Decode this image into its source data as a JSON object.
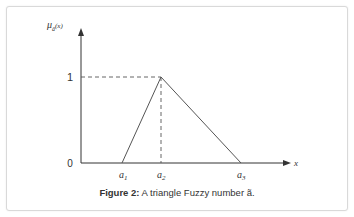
{
  "figure": {
    "caption_label": "Figure 2:",
    "caption_text": " A triangle Fuzzy number ã."
  },
  "diagram": {
    "y_axis_label": "μ",
    "y_axis_label_sub": "ã",
    "y_axis_label_arg": "(x)",
    "x_axis_label": "x",
    "y_ticks": [
      "1",
      "0"
    ],
    "x_ticks": [
      {
        "base": "a",
        "sub": "1"
      },
      {
        "base": "a",
        "sub": "2"
      },
      {
        "base": "a",
        "sub": "3"
      }
    ],
    "colors": {
      "line": "#555555",
      "axis": "#333333",
      "frame": "#d9d9d9"
    }
  }
}
